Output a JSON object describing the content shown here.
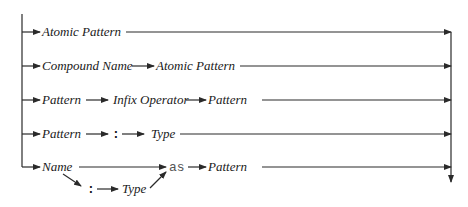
{
  "diagram": {
    "type": "railroad-syntax-diagram",
    "rows": [
      {
        "items": [
          "Atomic Pattern"
        ]
      },
      {
        "items": [
          "Compound Name",
          "Atomic Pattern"
        ]
      },
      {
        "items": [
          "Pattern",
          "Infix Operator",
          "Pattern"
        ]
      },
      {
        "items": [
          "Pattern",
          ":",
          "Type"
        ]
      },
      {
        "items": [
          "Name",
          "as",
          "Pattern"
        ],
        "optional_branch": [
          ":",
          "Type"
        ]
      }
    ]
  }
}
